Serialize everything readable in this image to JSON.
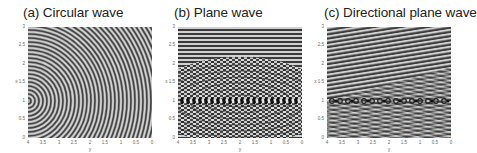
{
  "figure": {
    "panels": [
      {
        "title": "(a) Circular wave",
        "xlabel": "y",
        "ylabel": "x",
        "xticks": [
          "4",
          "3.5",
          "3",
          "2.5",
          "2",
          "1.5",
          "1",
          "0.5",
          "0"
        ],
        "yticks": [
          "3",
          "2.5",
          "2",
          "1.5",
          "1",
          "0.5",
          "0"
        ]
      },
      {
        "title": "(b) Plane wave",
        "xlabel": "y",
        "ylabel": "x",
        "xticks": [
          "4",
          "3.5",
          "3",
          "2.5",
          "2",
          "1.5",
          "1",
          "0.5",
          "0"
        ],
        "yticks": [
          "3",
          "2.5",
          "2",
          "1.5",
          "1",
          "0.5",
          "0"
        ]
      },
      {
        "title": "(c) Directional plane wave",
        "xlabel": "y",
        "ylabel": "x",
        "xticks": [
          "4",
          "3.5",
          "3",
          "2.5",
          "2",
          "1.5",
          "1",
          "0.5",
          "0"
        ],
        "yticks": [
          "3",
          "2.5",
          "2",
          "1.5",
          "1",
          "0.5",
          "0"
        ]
      }
    ],
    "colors": {
      "wave_light": "#d0d0d0",
      "wave_dark": "#3a3a3a",
      "background": "#9a9a9a"
    }
  }
}
